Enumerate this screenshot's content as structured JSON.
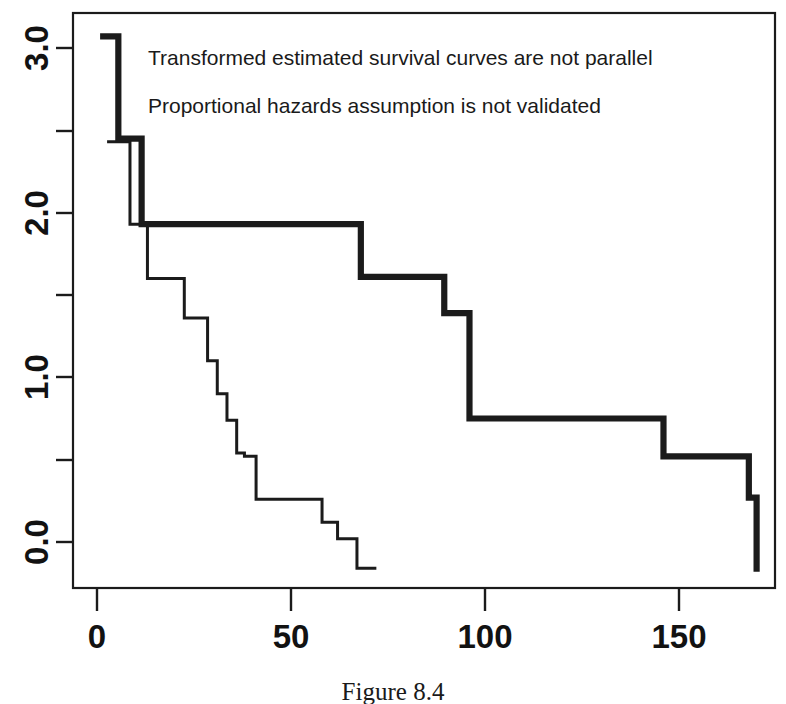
{
  "figure": {
    "caption": "Figure 8.4",
    "background_color": "#ffffff",
    "ink_color": "#1b1b1b"
  },
  "annotations": {
    "line1": "Transformed estimated survival curves are not parallel",
    "line2": "Proportional hazards assumption is not validated"
  },
  "axes": {
    "x_tick_labels": [
      "0",
      "50",
      "100",
      "150"
    ],
    "y_tick_labels": [
      "0.0",
      "1.0",
      "2.0",
      "3.0"
    ]
  },
  "chart_data": {
    "type": "line",
    "title": "",
    "subtitle": "",
    "xlabel": "",
    "ylabel": "",
    "xlim": [
      -7,
      174
    ],
    "ylim": [
      -0.42,
      3.23
    ],
    "x_ticks": [
      0,
      50,
      100,
      150
    ],
    "x_tick_labels": [
      "0",
      "50",
      "100",
      "150"
    ],
    "y_ticks": [
      0.0,
      0.5,
      1.0,
      1.5,
      2.0,
      2.5,
      3.0
    ],
    "y_tick_labels": [
      "0.0",
      "",
      "1.0",
      "",
      "2.0",
      "",
      "3.0"
    ],
    "y_labeled_ticks": [
      0.0,
      1.0,
      2.0,
      3.0
    ],
    "grid": false,
    "legend": false,
    "legend_position": "none",
    "step_shape": "hv",
    "annotations": [
      {
        "text": "Transformed estimated survival curves are not parallel",
        "x": 13,
        "y": 2.93
      },
      {
        "text": "Proportional hazards assumption is not validated",
        "x": 13,
        "y": 2.63
      }
    ],
    "series": [
      {
        "name": "group-1-thick",
        "line_style": "solid",
        "line_width": "thick",
        "color": "#1b1b1b",
        "x": [
          0.8,
          2.3,
          5.5,
          11.5,
          54.0,
          68.0,
          89.5,
          96.0,
          143.0,
          146.0,
          168.0,
          170.0
        ],
        "y": [
          3.07,
          3.07,
          2.45,
          1.93,
          1.93,
          1.61,
          1.39,
          0.75,
          0.75,
          0.52,
          0.27,
          0.27
        ],
        "y_end": -0.18
      },
      {
        "name": "group-2-thin",
        "line_style": "solid",
        "line_width": "thin",
        "color": "#1b1b1b",
        "x": [
          2.6,
          4.4,
          8.5,
          13.0,
          19.5,
          22.5,
          26.5,
          28.5,
          31.0,
          33.5,
          36.0,
          38.0,
          41.0,
          46.0,
          52.0,
          58.0,
          62.0,
          67.0,
          72.0
        ],
        "y": [
          2.43,
          2.43,
          1.93,
          1.6,
          1.6,
          1.36,
          1.36,
          1.1,
          0.9,
          0.74,
          0.54,
          0.52,
          0.26,
          0.26,
          0.26,
          0.12,
          0.02,
          -0.16,
          -0.16
        ],
        "y_end": -0.16
      }
    ]
  }
}
